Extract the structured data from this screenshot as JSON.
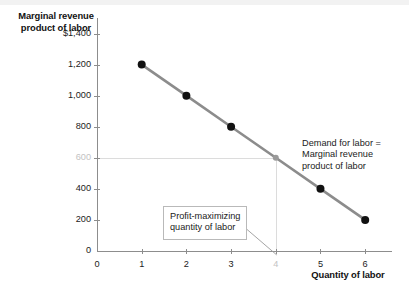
{
  "chart_data": {
    "type": "line",
    "title": "",
    "xlabel": "Quantity of labor",
    "ylabel": "Marginal revenue product of labor",
    "x": [
      1,
      2,
      3,
      4,
      5,
      6
    ],
    "values": [
      1200,
      1000,
      800,
      600,
      400,
      200
    ],
    "series": [
      {
        "name": "Demand for labor = Marginal revenue product of labor",
        "values": [
          1200,
          1000,
          800,
          600,
          400,
          200
        ]
      }
    ],
    "xlim": [
      0,
      6.6
    ],
    "ylim": [
      0,
      1500
    ],
    "xticks": [
      "0",
      "1",
      "2",
      "3",
      "4",
      "5",
      "6"
    ],
    "yticks": [
      "0",
      "200",
      "400",
      "600",
      "800",
      "1,000",
      "1,200",
      "$1,400"
    ],
    "grid": false,
    "legend_position": "inline-annotation",
    "highlight_point": {
      "x": 4,
      "y": 600,
      "xtick_label": "4",
      "ytick_label": "600"
    },
    "annotations": [
      {
        "name": "demand-curve-label",
        "lines": [
          "Demand for labor =",
          "Marginal revenue",
          "product of labor"
        ]
      },
      {
        "name": "profit-maximizing-callout",
        "lines": [
          "Profit-maximizing",
          "quantity of labor"
        ]
      }
    ],
    "colors": {
      "line": "#8c8c8c",
      "marker": "#111111",
      "highlight_marker": "#9a9a9a",
      "guide": "#dcdcdc",
      "axis": "#8d8d8d",
      "text": "#1b1b1b",
      "muted_text": "#c3c3c3"
    }
  },
  "axis": {
    "y_title": "Marginal revenue product of labor",
    "x_title": "Quantity of labor",
    "y_ticks": [
      {
        "label": "$1,400",
        "value": 1400,
        "muted": false
      },
      {
        "label": "1,200",
        "value": 1200,
        "muted": false
      },
      {
        "label": "1,000",
        "value": 1000,
        "muted": false
      },
      {
        "label": "800",
        "value": 800,
        "muted": false
      },
      {
        "label": "600",
        "value": 600,
        "muted": true
      },
      {
        "label": "400",
        "value": 400,
        "muted": false
      },
      {
        "label": "200",
        "value": 200,
        "muted": false
      },
      {
        "label": "0",
        "value": 0,
        "muted": false
      }
    ],
    "x_ticks": [
      {
        "label": "0",
        "value": 0,
        "muted": false
      },
      {
        "label": "1",
        "value": 1,
        "muted": false
      },
      {
        "label": "2",
        "value": 2,
        "muted": false
      },
      {
        "label": "3",
        "value": 3,
        "muted": false
      },
      {
        "label": "4",
        "value": 4,
        "muted": true
      },
      {
        "label": "5",
        "value": 5,
        "muted": false
      },
      {
        "label": "6",
        "value": 6,
        "muted": false
      }
    ]
  },
  "annotations": {
    "demand": {
      "line1": "Demand for labor =",
      "line2": "Marginal revenue",
      "line3": "product of labor"
    },
    "profit_callout": {
      "line1": "Profit-maximizing",
      "line2": "quantity of labor"
    }
  }
}
